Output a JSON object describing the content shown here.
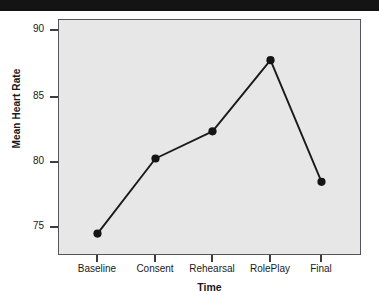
{
  "chart_data": {
    "type": "line",
    "title": "",
    "xlabel": "Time",
    "ylabel": "Mean Heart Rate",
    "categories": [
      "Baseline",
      "Consent",
      "Rehearsal",
      "RolePlay",
      "Final"
    ],
    "values": [
      74.6,
      80.4,
      82.5,
      88.0,
      78.6
    ],
    "series": [
      {
        "name": "Mean Heart Rate",
        "values": [
          74.6,
          80.4,
          82.5,
          88.0,
          78.6
        ]
      }
    ],
    "ylim": [
      73.1,
      91.1
    ],
    "yticks": [
      75,
      80,
      85,
      90
    ],
    "ytick_labels": [
      "75",
      "80",
      "85",
      "90"
    ],
    "xtick_labels": [
      "Baseline",
      "Consent",
      "Rehearsal",
      "RolePlay",
      "Final"
    ],
    "grid": false,
    "legend": false,
    "legend_position": "none",
    "marker": "filled-circle",
    "colors": {
      "line": "#1a1a1a",
      "marker": "#141414",
      "plot_background": "#e7e7e7",
      "frame": "#53555a",
      "page_background": "#ffffff",
      "text": "#1a1a1a"
    }
  }
}
